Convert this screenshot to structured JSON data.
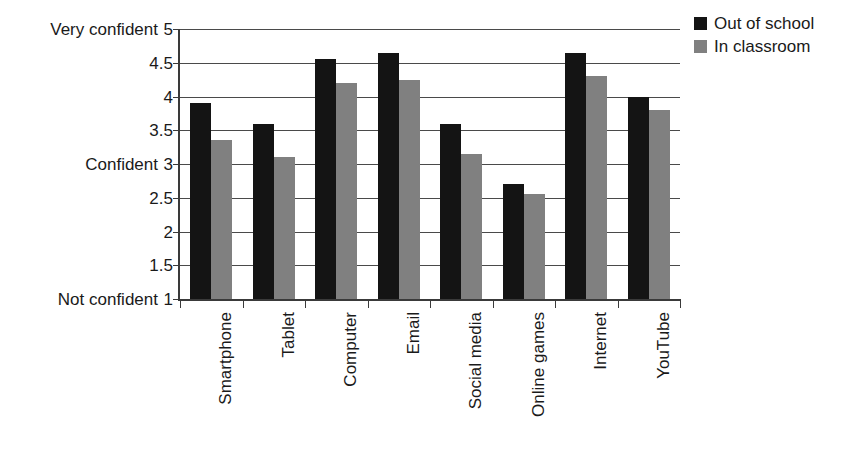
{
  "chart_data": {
    "type": "bar",
    "title": "",
    "xlabel": "",
    "ylabel": "",
    "ylim": [
      1,
      5
    ],
    "ytick_values": [
      1,
      1.5,
      2,
      2.5,
      3,
      3.5,
      4,
      4.5,
      5
    ],
    "ytick_labels": [
      "1",
      "1.5",
      "2",
      "2.5",
      "3",
      "3.5",
      "4",
      "4.5",
      "5"
    ],
    "y_category_labels": [
      {
        "value": 5,
        "text": "Very confident"
      },
      {
        "value": 3,
        "text": "Confident"
      },
      {
        "value": 1,
        "text": "Not confident"
      }
    ],
    "grid": true,
    "grid_axis": "y",
    "legend_position": "top-right",
    "categories": [
      "Smartphone",
      "Tablet",
      "Computer",
      "Email",
      "Social media",
      "Online games",
      "Internet",
      "YouTube"
    ],
    "series": [
      {
        "name": "Out of school",
        "color": "#141414",
        "values": [
          3.9,
          3.6,
          4.55,
          4.65,
          3.6,
          2.7,
          4.65,
          4.0
        ]
      },
      {
        "name": "In classroom",
        "color": "#808080",
        "values": [
          3.35,
          3.1,
          4.2,
          4.25,
          3.15,
          2.55,
          4.3,
          3.8
        ]
      }
    ]
  },
  "legend": {
    "items": [
      {
        "label": "Out of school",
        "color": "#141414"
      },
      {
        "label": "In classroom",
        "color": "#808080"
      }
    ]
  },
  "colors": {
    "series_out_of_school": "#141414",
    "series_in_classroom": "#808080",
    "axis": "#3a3a3a",
    "gridline": "#4a4a4a",
    "text": "#1a1a1a",
    "background": "#ffffff"
  }
}
